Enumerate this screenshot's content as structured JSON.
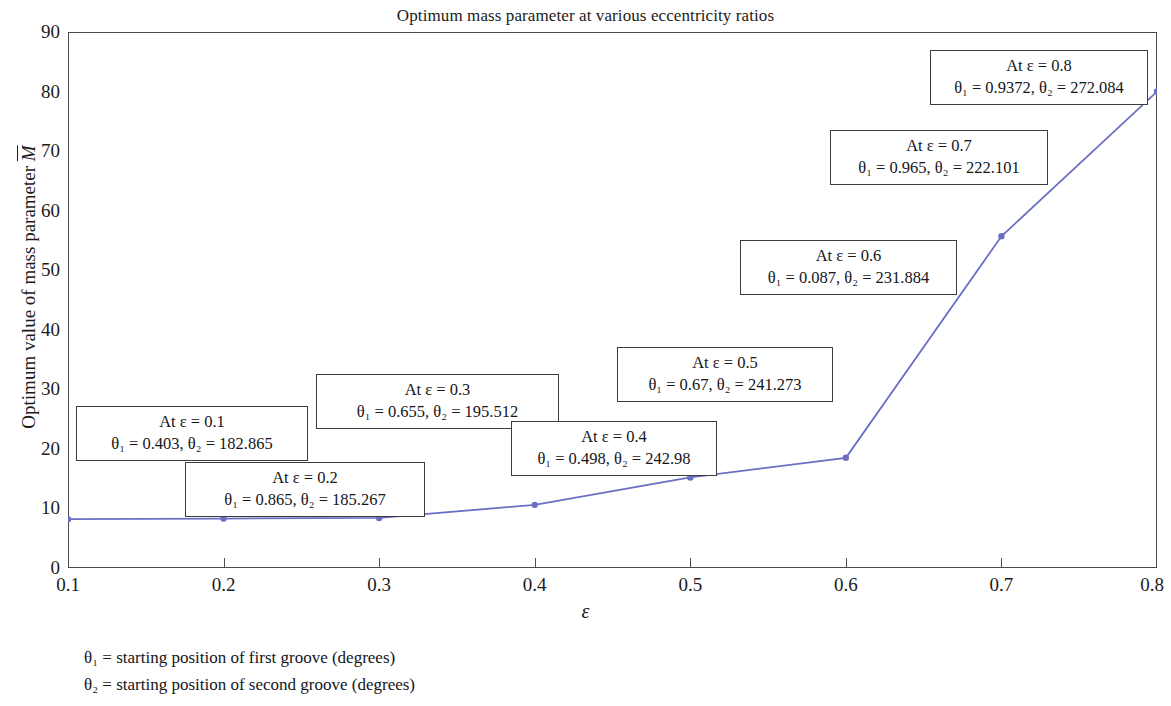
{
  "chart_data": {
    "type": "line",
    "title": "Optimum mass parameter at various eccentricity ratios",
    "xlabel": "ε",
    "ylabel": "Optimum value of mass parameter M̅",
    "x": [
      0.1,
      0.2,
      0.3,
      0.4,
      0.5,
      0.6,
      0.7,
      0.8
    ],
    "values": [
      8.2,
      8.3,
      8.4,
      10.6,
      15.2,
      18.5,
      55.7,
      80.0
    ],
    "xlim": [
      0.1,
      0.8
    ],
    "ylim": [
      0,
      90
    ],
    "xticks": [
      "0.1",
      "0.2",
      "0.3",
      "0.4",
      "0.5",
      "0.6",
      "0.7",
      "0.8"
    ],
    "yticks": [
      "0",
      "10",
      "20",
      "30",
      "40",
      "50",
      "60",
      "70",
      "80",
      "90"
    ],
    "grid": false,
    "legend": "none",
    "series_color": "#6b6fc4",
    "marker": "circle",
    "annotations": [
      {
        "line1": "At ε = 0.1",
        "line2": "θ₁ = 0.403, θ₂ = 182.865",
        "eps": "0.1",
        "theta1": "0.403",
        "theta2": "182.865"
      },
      {
        "line1": "At ε = 0.2",
        "line2": "θ₁ = 0.865, θ₂ = 185.267",
        "eps": "0.2",
        "theta1": "0.865",
        "theta2": "185.267"
      },
      {
        "line1": "At ε = 0.3",
        "line2": "θ₁ = 0.655, θ₂ = 195.512",
        "eps": "0.3",
        "theta1": "0.655",
        "theta2": "195.512"
      },
      {
        "line1": "At ε = 0.4",
        "line2": "θ₁ = 0.498, θ₂ = 242.98",
        "eps": "0.4",
        "theta1": "0.498",
        "theta2": "242.98"
      },
      {
        "line1": "At ε = 0.5",
        "line2": "θ₁ = 0.67, θ₂ = 241.273",
        "eps": "0.5",
        "theta1": "0.67",
        "theta2": "241.273"
      },
      {
        "line1": "At ε = 0.6",
        "line2": "θ₁ = 0.087, θ₂ = 231.884",
        "eps": "0.6",
        "theta1": "0.087",
        "theta2": "231.884"
      },
      {
        "line1": "At ε = 0.7",
        "line2": "θ₁ = 0.965, θ₂ = 222.101",
        "eps": "0.7",
        "theta1": "0.965",
        "theta2": "222.101"
      },
      {
        "line1": "At ε = 0.8",
        "line2": "θ₁ = 0.9372, θ₂ = 272.084",
        "eps": "0.8",
        "theta1": "0.9372",
        "theta2": "272.084"
      }
    ],
    "footnotes": [
      "θ₁ = starting position of first groove (degrees)",
      "θ₂ = starting position of second groove (degrees)"
    ]
  },
  "axis": {
    "yticks": [
      "90",
      "80",
      "70",
      "60",
      "50",
      "40",
      "30",
      "20",
      "10",
      "0"
    ],
    "xticks": [
      "0.1",
      "0.2",
      "0.3",
      "0.4",
      "0.5",
      "0.6",
      "0.7",
      "0.8"
    ]
  }
}
